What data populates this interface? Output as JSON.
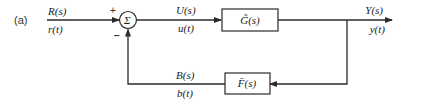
{
  "diagram": {
    "label": "(a)",
    "input": {
      "laplace": "R(s)",
      "time": "r(t)"
    },
    "summing_junction": {
      "symbol": "Σ",
      "plus_sign": "+",
      "minus_sign": "−"
    },
    "control_signal": {
      "laplace": "U(s)",
      "time": "u(t)"
    },
    "forward_block": {
      "label": "G̃(s)"
    },
    "output": {
      "laplace": "Y(s)",
      "time": "y(t)"
    },
    "feedback_block": {
      "label": "F̄(s)"
    },
    "feedback_signal": {
      "laplace": "B(s)",
      "time": "b(t)"
    },
    "colors": {
      "line": "#2a2a2a",
      "text": "#222222",
      "background": "#ffffff"
    }
  }
}
